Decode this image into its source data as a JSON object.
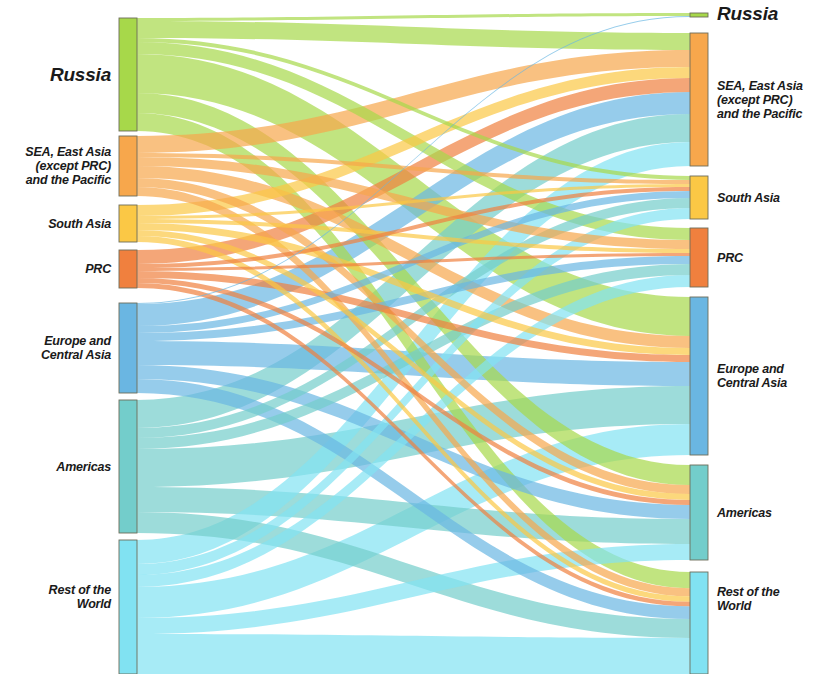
{
  "chart_data": {
    "type": "sankey",
    "title": "",
    "xlabel": "",
    "ylabel": "",
    "legend_position": "none",
    "grid": false,
    "note": "Two-column Sankey flow diagram: left column = origin regions, right column = destination regions. Flow widths are proportional to share. Flow color follows the source (left) node color.",
    "colors": {
      "russia": "#a7d84a",
      "sea_east_asia_pacific": "#f7a74c",
      "south_asia": "#fbc845",
      "prc": "#f0803e",
      "europe_central_asia": "#6ab6e2",
      "americas": "#73cdcb",
      "rest_of_world": "#81e2f2",
      "node_stroke": "#6d6d5a",
      "background": "#ffffff",
      "text": "#1a1a1a"
    },
    "left_nodes": [
      {
        "key": "russia",
        "label": "Russia",
        "y0": 18,
        "y1": 131,
        "value": 113,
        "color_key": "russia"
      },
      {
        "key": "sea_east_asia_pacific",
        "label": "SEA, East Asia\n(except PRC)\nand the Pacific",
        "y0": 136,
        "y1": 196,
        "value": 60,
        "color_key": "sea_east_asia_pacific"
      },
      {
        "key": "south_asia",
        "label": "South Asia",
        "y0": 205,
        "y1": 242,
        "value": 37,
        "color_key": "south_asia"
      },
      {
        "key": "prc",
        "label": "PRC",
        "y0": 250,
        "y1": 288,
        "value": 38,
        "color_key": "prc"
      },
      {
        "key": "europe_central_asia",
        "label": "Europe and\nCentral Asia",
        "y0": 303,
        "y1": 393,
        "value": 90,
        "color_key": "europe_central_asia"
      },
      {
        "key": "americas",
        "label": "Americas",
        "y0": 400,
        "y1": 533,
        "value": 133,
        "color_key": "americas"
      },
      {
        "key": "rest_of_world",
        "label": "Rest of the\nWorld",
        "y0": 540,
        "y1": 674,
        "value": 134,
        "color_key": "rest_of_world"
      }
    ],
    "right_nodes": [
      {
        "key": "russia",
        "label": "Russia",
        "y0": 13,
        "y1": 17,
        "value": 4,
        "color_key": "russia"
      },
      {
        "key": "sea_east_asia_pacific",
        "label": "SEA, East Asia\n(except PRC)\nand the Pacific",
        "y0": 33,
        "y1": 166,
        "value": 133,
        "color_key": "sea_east_asia_pacific"
      },
      {
        "key": "south_asia",
        "label": "South Asia",
        "y0": 176,
        "y1": 219,
        "value": 43,
        "color_key": "south_asia"
      },
      {
        "key": "prc",
        "label": "PRC",
        "y0": 228,
        "y1": 287,
        "value": 59,
        "color_key": "prc"
      },
      {
        "key": "europe_central_asia",
        "label": "Europe and\nCentral Asia",
        "y0": 297,
        "y1": 455,
        "value": 158,
        "color_key": "europe_central_asia"
      },
      {
        "key": "americas",
        "label": "Americas",
        "y0": 465,
        "y1": 560,
        "value": 95,
        "color_key": "americas"
      },
      {
        "key": "rest_of_world",
        "label": "Rest of the\nWorld",
        "y0": 572,
        "y1": 674,
        "value": 102,
        "color_key": "rest_of_world"
      }
    ],
    "links": [
      {
        "source": "russia",
        "target": "russia",
        "value": 3
      },
      {
        "source": "russia",
        "target": "sea_east_asia_pacific",
        "value": 17
      },
      {
        "source": "russia",
        "target": "south_asia",
        "value": 4
      },
      {
        "source": "russia",
        "target": "prc",
        "value": 12
      },
      {
        "source": "russia",
        "target": "europe_central_asia",
        "value": 39
      },
      {
        "source": "russia",
        "target": "americas",
        "value": 20
      },
      {
        "source": "russia",
        "target": "rest_of_world",
        "value": 18
      },
      {
        "source": "sea_east_asia_pacific",
        "target": "sea_east_asia_pacific",
        "value": 17
      },
      {
        "source": "sea_east_asia_pacific",
        "target": "south_asia",
        "value": 4
      },
      {
        "source": "sea_east_asia_pacific",
        "target": "prc",
        "value": 9
      },
      {
        "source": "sea_east_asia_pacific",
        "target": "europe_central_asia",
        "value": 12
      },
      {
        "source": "sea_east_asia_pacific",
        "target": "americas",
        "value": 9
      },
      {
        "source": "sea_east_asia_pacific",
        "target": "rest_of_world",
        "value": 9
      },
      {
        "source": "south_asia",
        "target": "sea_east_asia_pacific",
        "value": 11
      },
      {
        "source": "south_asia",
        "target": "south_asia",
        "value": 3
      },
      {
        "source": "south_asia",
        "target": "prc",
        "value": 4
      },
      {
        "source": "south_asia",
        "target": "europe_central_asia",
        "value": 7
      },
      {
        "source": "south_asia",
        "target": "americas",
        "value": 6
      },
      {
        "source": "south_asia",
        "target": "rest_of_world",
        "value": 6
      },
      {
        "source": "prc",
        "target": "sea_east_asia_pacific",
        "value": 14
      },
      {
        "source": "prc",
        "target": "south_asia",
        "value": 4
      },
      {
        "source": "prc",
        "target": "prc",
        "value": 3
      },
      {
        "source": "prc",
        "target": "europe_central_asia",
        "value": 7
      },
      {
        "source": "prc",
        "target": "americas",
        "value": 5
      },
      {
        "source": "prc",
        "target": "rest_of_world",
        "value": 5
      },
      {
        "source": "europe_central_asia",
        "target": "russia",
        "value": 1
      },
      {
        "source": "europe_central_asia",
        "target": "sea_east_asia_pacific",
        "value": 22
      },
      {
        "source": "europe_central_asia",
        "target": "south_asia",
        "value": 7
      },
      {
        "source": "europe_central_asia",
        "target": "prc",
        "value": 8
      },
      {
        "source": "europe_central_asia",
        "target": "europe_central_asia",
        "value": 24
      },
      {
        "source": "europe_central_asia",
        "target": "americas",
        "value": 14
      },
      {
        "source": "europe_central_asia",
        "target": "rest_of_world",
        "value": 14
      },
      {
        "source": "americas",
        "target": "sea_east_asia_pacific",
        "value": 28
      },
      {
        "source": "americas",
        "target": "south_asia",
        "value": 10
      },
      {
        "source": "americas",
        "target": "prc",
        "value": 11
      },
      {
        "source": "americas",
        "target": "europe_central_asia",
        "value": 38
      },
      {
        "source": "americas",
        "target": "americas",
        "value": 25
      },
      {
        "source": "americas",
        "target": "rest_of_world",
        "value": 21
      },
      {
        "source": "rest_of_world",
        "target": "sea_east_asia_pacific",
        "value": 24
      },
      {
        "source": "rest_of_world",
        "target": "south_asia",
        "value": 11
      },
      {
        "source": "rest_of_world",
        "target": "prc",
        "value": 12
      },
      {
        "source": "rest_of_world",
        "target": "europe_central_asia",
        "value": 31
      },
      {
        "source": "rest_of_world",
        "target": "americas",
        "value": 16
      },
      {
        "source": "rest_of_world",
        "target": "rest_of_world",
        "value": 40
      }
    ],
    "geometry": {
      "left_node_x": 119,
      "right_node_x": 690,
      "node_width": 18,
      "canvas_width": 816,
      "canvas_height": 674
    }
  },
  "labels": {
    "left": {
      "russia": "Russia",
      "sea_east_asia_pacific": "SEA, East Asia\n(except PRC)\nand the Pacific",
      "south_asia": "South Asia",
      "prc": "PRC",
      "europe_central_asia": "Europe and\nCentral Asia",
      "americas": "Americas",
      "rest_of_world": "Rest of the\nWorld"
    },
    "right": {
      "russia": "Russia",
      "sea_east_asia_pacific": "SEA, East Asia\n(except PRC)\nand the Pacific",
      "south_asia": "South Asia",
      "prc": "PRC",
      "europe_central_asia": "Europe and\nCentral Asia",
      "americas": "Americas",
      "rest_of_world": "Rest of the\nWorld"
    }
  }
}
